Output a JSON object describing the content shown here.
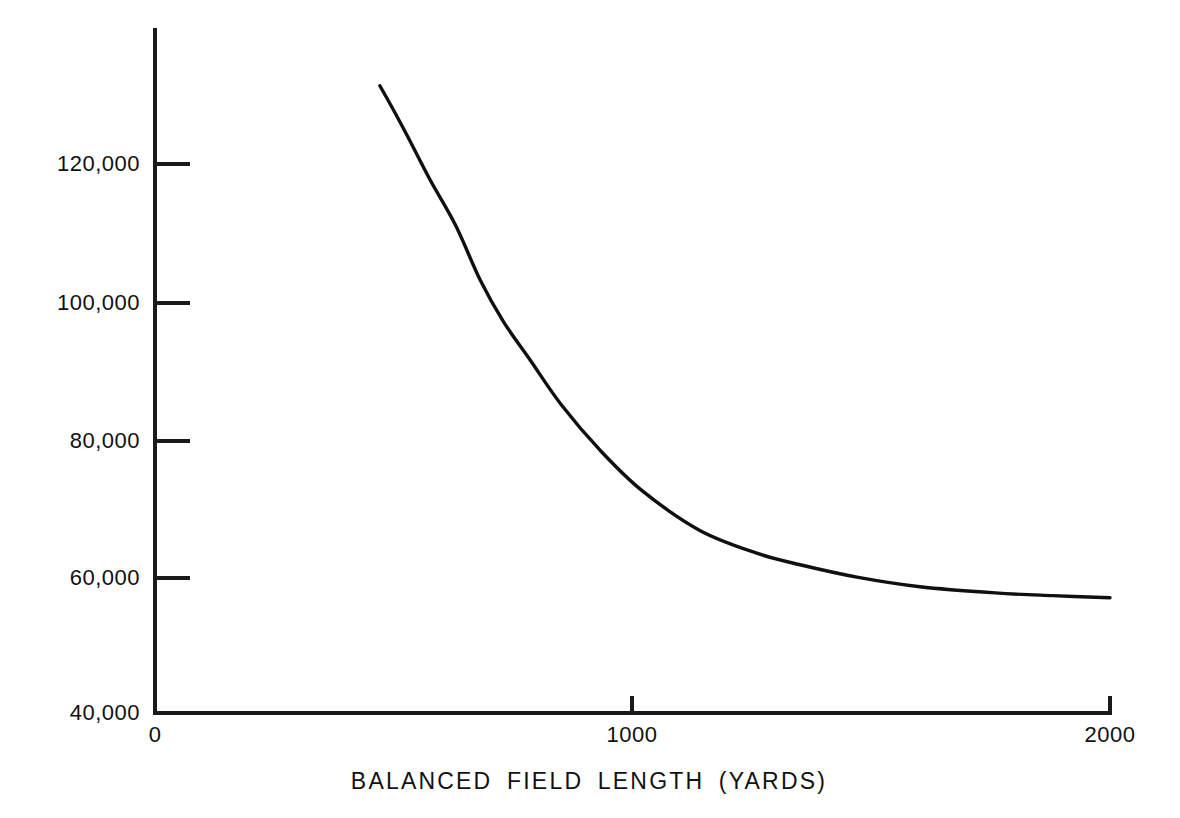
{
  "chart_data": {
    "type": "line",
    "title": "",
    "xlabel": "BALANCED FIELD LENGTH (YARDS)",
    "ylabel": "",
    "xlim": [
      0,
      2000
    ],
    "ylim": [
      40000,
      133000
    ],
    "grid": false,
    "legend": null,
    "xticks": [
      {
        "value": 0,
        "label": "0"
      },
      {
        "value": 1000,
        "label": "1000"
      },
      {
        "value": 2000,
        "label": "2000"
      }
    ],
    "yticks": [
      {
        "value": 40000,
        "label": "40,000"
      },
      {
        "value": 60000,
        "label": "60,000"
      },
      {
        "value": 80000,
        "label": "80,000"
      },
      {
        "value": 100000,
        "label": "100,000"
      },
      {
        "value": 120000,
        "label": "120,000"
      }
    ],
    "series": [
      {
        "name": "weight-vs-field-length",
        "color": "#101010",
        "x": [
          471,
          500,
          530,
          576,
          630,
          681,
          730,
          786,
          850,
          932,
          1020,
          1141,
          1260,
          1351,
          1470,
          1602,
          1760,
          1880,
          2000
        ],
        "y": [
          131400,
          127800,
          123900,
          117700,
          111000,
          103100,
          97000,
          91400,
          85000,
          78300,
          72400,
          66600,
          63300,
          61600,
          59800,
          58400,
          57500,
          57100,
          56800
        ]
      }
    ]
  },
  "figure": {
    "axis_color": "#1a1a1a",
    "background": "#ffffff",
    "curve_color": "#101010"
  }
}
